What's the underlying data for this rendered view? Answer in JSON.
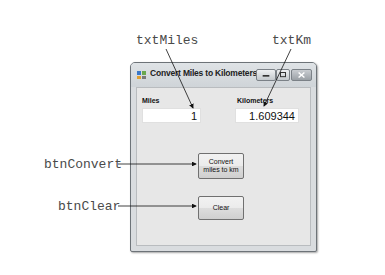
{
  "callouts": {
    "txt_miles": "txtMiles",
    "txt_km": "txtKm",
    "btn_convert": "btnConvert",
    "btn_clear": "btnClear"
  },
  "window": {
    "title": "Convert Miles to Kilometers",
    "icon": "form-icon",
    "controls": [
      "minimize",
      "maximize",
      "close"
    ]
  },
  "form": {
    "miles_label": "Miles",
    "miles_value": "1",
    "km_label": "Kilometers",
    "km_value": "1.609344",
    "convert_button": "Convert miles to km",
    "convert_button_line1": "Convert",
    "convert_button_line2": "miles to km",
    "clear_button": "Clear"
  }
}
